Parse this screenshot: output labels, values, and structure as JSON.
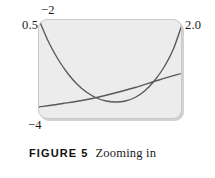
{
  "figure": {
    "caption_number": "FIGURE 5",
    "caption_text": "Zooming in",
    "viewport_labels": {
      "y_max": "−2",
      "x_min": "0.5",
      "x_max": "2.0",
      "y_min": "−4"
    }
  },
  "chart_data": {
    "type": "line",
    "title": "",
    "subtitle": "",
    "xlabel": "",
    "ylabel": "",
    "xlim": [
      0.5,
      2.0
    ],
    "ylim": [
      -4,
      -2
    ],
    "grid": false,
    "legend": "none",
    "annotations": [
      "Viewing rectangle [0.5, 2.0] by [−4, −2]",
      "Two curves are tangent-like / intersect near the right of the window"
    ],
    "series": [
      {
        "name": "parabola",
        "color": "#595959",
        "x": [
          0.5,
          0.6,
          0.7,
          0.8,
          0.9,
          1.0,
          1.1,
          1.2,
          1.3,
          1.4,
          1.5,
          1.6,
          1.7,
          1.8,
          1.9,
          2.0
        ],
        "y": [
          -2.0,
          -2.44,
          -2.79,
          -3.07,
          -3.29,
          -3.45,
          -3.56,
          -3.62,
          -3.64,
          -3.62,
          -3.55,
          -3.42,
          -3.22,
          -2.95,
          -2.58,
          -2.03
        ]
      },
      {
        "name": "line",
        "color": "#595959",
        "x": [
          0.5,
          0.75,
          1.0,
          1.25,
          1.5,
          1.75,
          2.0
        ],
        "y": [
          -3.74,
          -3.67,
          -3.59,
          -3.48,
          -3.35,
          -3.2,
          -3.06
        ]
      }
    ]
  }
}
